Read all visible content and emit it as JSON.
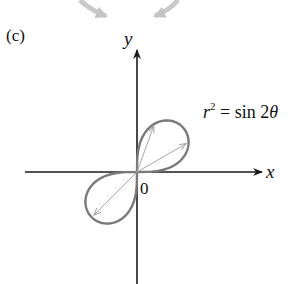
{
  "figure": {
    "panel_label": "(c)",
    "axes": {
      "x_label": "x",
      "y_label": "y",
      "origin_label": "0",
      "axis_color": "#1a1a1a"
    },
    "equation": {
      "lhs_var": "r",
      "lhs_exp": "2",
      "equals": " = sin 2",
      "theta": "θ"
    },
    "curve": {
      "type": "lemniscate",
      "formula": "r^2 = sin 2θ",
      "color": "#7a7a7a",
      "radius_vectors_color": "#a8a8a8",
      "radius_vectors_theta_deg": [
        70,
        30,
        225
      ]
    },
    "decorative_arrows": {
      "color": "#c4c4c4",
      "count": 2
    }
  }
}
